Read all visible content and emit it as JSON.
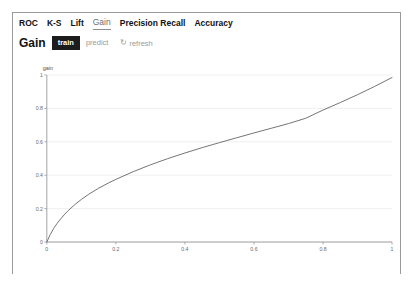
{
  "tabs": [
    {
      "label": "ROC",
      "active": false
    },
    {
      "label": "K-S",
      "active": false
    },
    {
      "label": "Lift",
      "active": false
    },
    {
      "label": "Gain",
      "active": true
    },
    {
      "label": "Precision Recall",
      "active": false
    },
    {
      "label": "Accuracy",
      "active": false
    }
  ],
  "toolbar": {
    "title": "Gain",
    "train_label": "train",
    "predict_label": "predict",
    "refresh_label": "refresh",
    "refresh_icon": "↻",
    "selected_dataset": "train"
  },
  "colors": {
    "curve": "#6d6d70",
    "grid": "#e9e9ea",
    "axis": "#8e8e90",
    "active_button_bg": "#1c1c1c",
    "inactive_text": "#9b9b9b",
    "panel_border": "#9a9a9a"
  },
  "chart_data": {
    "type": "line",
    "title": "",
    "xlabel": "",
    "ylabel": "gain",
    "xlim": [
      0,
      1
    ],
    "ylim": [
      0,
      1
    ],
    "grid": true,
    "legend": "none",
    "xticks": [
      "0",
      "0.2",
      "0.4",
      "0.6",
      "0.8",
      "1"
    ],
    "xtick_values": [
      0,
      0.2,
      0.4,
      0.6,
      0.8,
      1
    ],
    "yticks": [
      "0",
      "0.2",
      "0.4",
      "0.6",
      "0.8",
      "1"
    ],
    "ytick_values": [
      0,
      0.2,
      0.4,
      0.6,
      0.8,
      1
    ],
    "series": [
      {
        "name": "train",
        "x": [
          0,
          0.01,
          0.02,
          0.03,
          0.04,
          0.05,
          0.06,
          0.08,
          0.1,
          0.12,
          0.15,
          0.18,
          0.2,
          0.25,
          0.3,
          0.35,
          0.4,
          0.45,
          0.5,
          0.55,
          0.6,
          0.65,
          0.7,
          0.75,
          0.8,
          0.85,
          0.9,
          0.95,
          1.0
        ],
        "y": [
          0,
          0.045,
          0.082,
          0.112,
          0.138,
          0.162,
          0.184,
          0.222,
          0.255,
          0.284,
          0.322,
          0.355,
          0.375,
          0.421,
          0.462,
          0.499,
          0.533,
          0.565,
          0.595,
          0.624,
          0.653,
          0.681,
          0.709,
          0.741,
          0.79,
          0.835,
          0.882,
          0.932,
          0.985
        ]
      }
    ]
  }
}
